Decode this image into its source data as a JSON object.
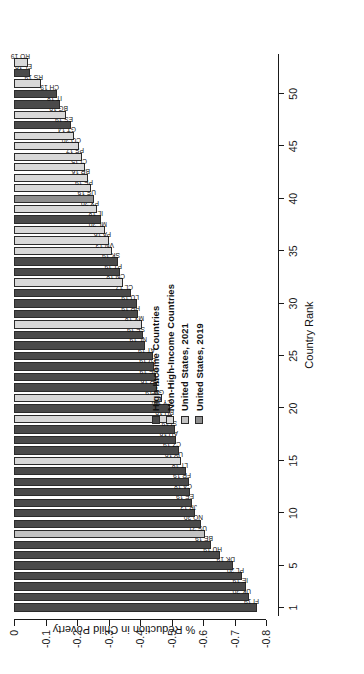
{
  "chart_data": {
    "type": "bar",
    "title": "",
    "xlabel": "Country Rank",
    "ylabel": "% Reduction in Child Poverty",
    "ylim": [
      -0.8,
      0
    ],
    "ytick_labels": [
      "0",
      "-0.1",
      "-0.2",
      "-0.3",
      "-0.4",
      "-0.5",
      "-0.6",
      "-0.7",
      "-0.8"
    ],
    "ytick_values": [
      0,
      -0.1,
      -0.2,
      -0.3,
      -0.4,
      -0.5,
      -0.6,
      -0.7,
      -0.8
    ],
    "xtick_labels": [
      "1",
      "5",
      "10",
      "15",
      "20",
      "25",
      "30",
      "35",
      "40",
      "45",
      "50"
    ],
    "xtick_values": [
      1,
      5,
      10,
      15,
      20,
      25,
      30,
      35,
      40,
      45,
      50
    ],
    "grid": false,
    "legend_position": "center-right",
    "orientation": "vertical-bars-rotated-90",
    "categories": [
      "FI",
      "UK",
      "IE",
      "PL",
      "DK",
      "HU",
      "BE",
      "US",
      "NO",
      "JP",
      "EE",
      "CA",
      "FR",
      "LT",
      "UY",
      "CZ",
      "AU",
      "SI",
      "RU",
      "CY",
      "GE",
      "KR",
      "DE",
      "LV",
      "AT",
      "NL",
      "SE",
      "MX",
      "HR",
      "LU",
      "CL",
      "CN",
      "PT",
      "SK",
      "VN",
      "PA",
      "ML",
      "IL",
      "PY",
      "US",
      "PE",
      "BR",
      "CI",
      "PS",
      "CO",
      "GT",
      "ES",
      "BG",
      "IT",
      "CH",
      "RS",
      "EL",
      "RO"
    ],
    "years": [
      "19",
      "20",
      "19",
      "20",
      "19",
      "19",
      "19",
      "21",
      "20",
      "13",
      "19",
      "18",
      "19",
      "18",
      "19",
      "19",
      "18",
      "19",
      "19",
      "19",
      "19",
      "16",
      "19",
      "19",
      "19",
      "19",
      "19",
      "18",
      "19",
      "19",
      "17",
      "18",
      "19",
      "19",
      "13",
      "16",
      "20",
      "18",
      "20",
      "19",
      "19",
      "16",
      "15",
      "17",
      "20",
      "14",
      "19",
      "19",
      "18",
      "19",
      "19",
      "19",
      "19"
    ],
    "values": [
      -0.77,
      -0.745,
      -0.735,
      -0.725,
      -0.695,
      -0.655,
      -0.625,
      -0.605,
      -0.595,
      -0.575,
      -0.565,
      -0.56,
      -0.555,
      -0.545,
      -0.53,
      -0.525,
      -0.515,
      -0.51,
      -0.5,
      -0.495,
      -0.47,
      -0.455,
      -0.45,
      -0.445,
      -0.44,
      -0.415,
      -0.41,
      -0.405,
      -0.395,
      -0.39,
      -0.37,
      -0.345,
      -0.335,
      -0.33,
      -0.31,
      -0.3,
      -0.29,
      -0.275,
      -0.265,
      -0.255,
      -0.245,
      -0.235,
      -0.225,
      -0.215,
      -0.205,
      -0.19,
      -0.18,
      -0.165,
      -0.145,
      -0.135,
      -0.085,
      -0.05,
      -0.045
    ],
    "series_class": [
      "high",
      "high",
      "high",
      "high",
      "high",
      "high",
      "high",
      "us2021",
      "high",
      "high",
      "high",
      "high",
      "high",
      "high",
      "nonhigh",
      "high",
      "high",
      "high",
      "nonhigh",
      "high",
      "nonhigh",
      "high",
      "high",
      "high",
      "high",
      "high",
      "high",
      "nonhigh",
      "high",
      "high",
      "high",
      "nonhigh",
      "high",
      "high",
      "nonhigh",
      "nonhigh",
      "nonhigh",
      "high",
      "nonhigh",
      "us2019",
      "nonhigh",
      "nonhigh",
      "nonhigh",
      "nonhigh",
      "nonhigh",
      "nonhigh",
      "high",
      "nonhigh",
      "high",
      "high",
      "nonhigh",
      "high",
      "nonhigh"
    ],
    "legend": [
      {
        "label": "High-Income Countries",
        "key": "high",
        "color": "#4a4a4a"
      },
      {
        "label": "Non-High-Income Countries",
        "key": "nonhigh",
        "color": "#d8d8d8"
      },
      {
        "label": "United States, 2021",
        "key": "us2021",
        "color": "#c2c2c2"
      },
      {
        "label": "United States, 2019",
        "key": "us2019",
        "color": "#8f8f8f"
      }
    ]
  },
  "colors": {
    "high": "#4a4a4a",
    "nonhigh": "#d8d8d8",
    "us2021": "#c2c2c2",
    "us2019": "#8f8f8f",
    "axis": "#1a1a1a",
    "text": "#111111",
    "background": "#ffffff"
  }
}
